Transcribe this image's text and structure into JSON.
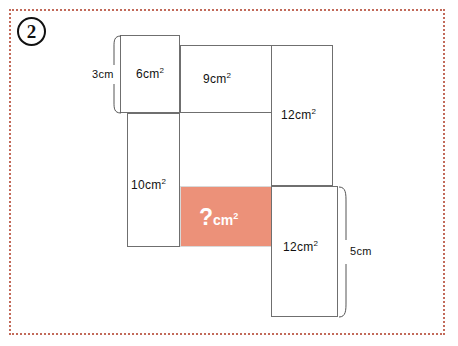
{
  "page": {
    "problem_number": "2",
    "border_color": "#c26a5a",
    "background_color": "#ffffff"
  },
  "figure": {
    "shaded_fill_color": "#ec9179",
    "line_color": "#6f6f6f",
    "unit": "cm",
    "exponent": "2",
    "regions": [
      {
        "name": "top-left-region",
        "label_value": "6",
        "label_unit": "cm",
        "label_exponent": "2",
        "label_text": "6cm",
        "x": 120,
        "y": 35,
        "width": 60,
        "height": 78,
        "shaded": false
      },
      {
        "name": "top-middle-region",
        "label_value": "9",
        "label_unit": "cm",
        "label_exponent": "2",
        "label_text": "9cm",
        "x": 180,
        "y": 45,
        "width": 92,
        "height": 68,
        "shaded": false
      },
      {
        "name": "right-upper-region",
        "label_value": "12",
        "label_unit": "cm",
        "label_exponent": "2",
        "label_text": "12cm",
        "x": 271,
        "y": 45,
        "width": 62,
        "height": 141,
        "shaded": false
      },
      {
        "name": "left-lower-region",
        "label_value": "10",
        "label_unit": "cm",
        "label_exponent": "2",
        "label_text": "10cm",
        "x": 127,
        "y": 113,
        "width": 53,
        "height": 134,
        "shaded": false
      },
      {
        "name": "unknown-shaded-region",
        "label_value": "?",
        "label_unit": "cm",
        "label_exponent": "2",
        "label_text": "?cm",
        "x": 180,
        "y": 186,
        "width": 92,
        "height": 61,
        "shaded": true
      },
      {
        "name": "right-lower-region",
        "label_value": "12",
        "label_unit": "cm",
        "label_exponent": "2",
        "label_text": "12cm",
        "x": 271,
        "y": 186,
        "width": 67,
        "height": 131,
        "shaded": false
      }
    ],
    "measurements": [
      {
        "name": "height-measure-3cm",
        "label": "3cm",
        "value": "3",
        "unit": "cm",
        "orientation": "vertical",
        "x": 110,
        "y": 35,
        "height": 78
      },
      {
        "name": "height-measure-5cm",
        "label": "5cm",
        "value": "5",
        "unit": "cm",
        "orientation": "vertical",
        "x": 338,
        "y": 186,
        "height": 131
      }
    ]
  }
}
